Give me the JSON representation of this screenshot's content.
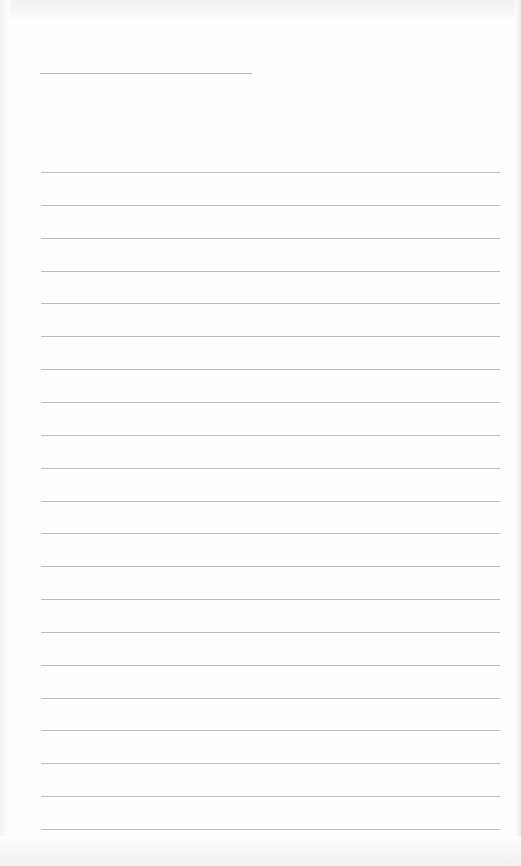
{
  "document": {
    "type": "lined-writing-sheet",
    "header_line": {
      "top": 73,
      "left": 40,
      "width": 212
    },
    "rules": {
      "count": 21,
      "first_top": 172,
      "spacing": 32.85,
      "left": 41,
      "width": 459
    },
    "colors": {
      "paper": "#fefefe",
      "rule": "#bdbdbd",
      "edge_shadow": "#ececec"
    }
  }
}
